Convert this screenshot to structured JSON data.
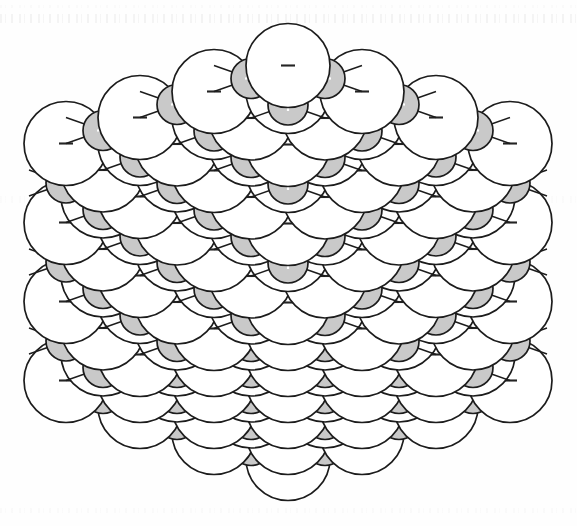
{
  "figure": {
    "caption": "",
    "width": 577,
    "height": 526,
    "background_color": "#fefefe"
  },
  "legend": {
    "anion": {
      "label": "anion",
      "charge_symbol": "−",
      "fill_color": "#ffffff",
      "stroke_color": "#1c1c1c",
      "symbol_color": "#242424",
      "radius_px": 42
    },
    "cation": {
      "label": "cation",
      "charge_symbol": "+",
      "fill_color": "#c9c9c9",
      "stroke_color": "#1c1c1c",
      "symbol_color": "#ffffff",
      "radius_px": 20
    }
  },
  "chart_data": {
    "type": "scatter",
    "xlabel": "",
    "ylabel": "",
    "grid": false,
    "legend_position": "none",
    "projection": {
      "kind": "axonometric",
      "origin_x": 288,
      "origin_y": 262,
      "axis_u": [
        74.0,
        -26.0
      ],
      "axis_v": [
        -74.0,
        -26.0
      ],
      "axis_w": [
        0.0,
        79.0
      ],
      "depth_weights": [
        1.0,
        1.0,
        -1.05
      ]
    },
    "lattice": {
      "type": "rock-salt",
      "nx": 4,
      "ny": 4,
      "nz": 4,
      "anion_parity": 0,
      "cation_parity": 1,
      "anion_radius": 42,
      "cation_radius": 20,
      "bond_stroke": "#1c1c1c",
      "bond_width": 1.4
    },
    "counts": {
      "anions_visible": 40,
      "cations_visible": 36,
      "total_spheres": 76
    },
    "categories": [
      "anion",
      "cation"
    ],
    "values": [
      40,
      36
    ]
  }
}
